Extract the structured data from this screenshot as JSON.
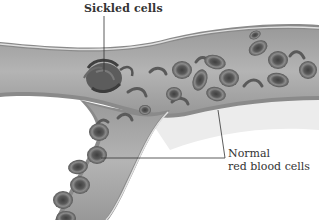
{
  "diagram": {
    "labels": {
      "sickled": "Sickled cells",
      "normal_line1": "Normal",
      "normal_line2": "red blood cells"
    },
    "colors": {
      "background": "#ffffff",
      "vessel_wall": "#8a8a8a",
      "vessel_lumen": "#a9a9a9",
      "vessel_highlight": "#d8d8d8",
      "cell_outer": "#6e6e6e",
      "cell_inner": "#4a4a4a",
      "sickled_clump": "#5a5a5a",
      "leader_line": "#333333",
      "shadow": "#e6e6e6"
    }
  }
}
